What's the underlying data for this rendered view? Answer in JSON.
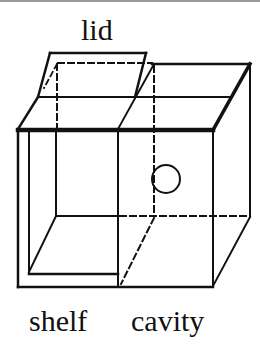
{
  "diagram": {
    "type": "isometric-box-diagram",
    "labels": {
      "lid": "lid",
      "shelf": "shelf",
      "cavity": "cavity"
    },
    "colors": {
      "stroke": "#111111",
      "background": "#ffffff",
      "top_rule": "#9a9a9a"
    },
    "components": [
      {
        "id": "lid",
        "description": "hinged flap lifted above the left compartment"
      },
      {
        "id": "shelf",
        "description": "open left compartment with inner walls"
      },
      {
        "id": "cavity",
        "description": "right closed compartment with circular hole on front"
      },
      {
        "id": "hole",
        "description": "circular opening on cavity face"
      }
    ]
  }
}
